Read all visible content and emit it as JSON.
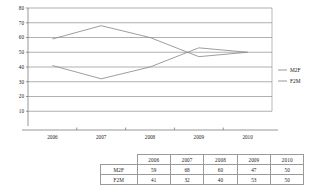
{
  "chart_data": {
    "type": "line",
    "title": "",
    "subtitle": "",
    "xlabel": "",
    "ylabel": "",
    "categories": [
      "2006",
      "2007",
      "2008",
      "2009",
      "2010"
    ],
    "series": [
      {
        "name": "M2F",
        "values": [
          59,
          68,
          60,
          47,
          50
        ]
      },
      {
        "name": "F2M",
        "values": [
          41,
          32,
          40,
          53,
          50
        ]
      }
    ],
    "ylim": [
      0,
      80
    ],
    "y_ticks": [
      10,
      20,
      30,
      40,
      50,
      60,
      70,
      80
    ],
    "y_tick_labels": [
      "10",
      "20",
      "30",
      "40",
      "50",
      "60",
      "70",
      "80"
    ],
    "x_tick_labels": [
      "2006",
      "2007",
      "2008",
      "2009",
      "2010"
    ],
    "grid": true,
    "legend_position": "right",
    "legend_entries": [
      "M2F",
      "F2M"
    ],
    "line_color": "#8c8c8c",
    "grid_color": "#7a7a7a",
    "text_color": "#1a1a1a"
  },
  "table": {
    "corner_label": "",
    "column_headers": [
      "2006",
      "2007",
      "2008",
      "2009",
      "2010"
    ],
    "rows": [
      {
        "label": "M2F",
        "values": [
          "59",
          "68",
          "60",
          "47",
          "50"
        ]
      },
      {
        "label": "F2M",
        "values": [
          "41",
          "32",
          "40",
          "53",
          "50"
        ]
      }
    ]
  }
}
